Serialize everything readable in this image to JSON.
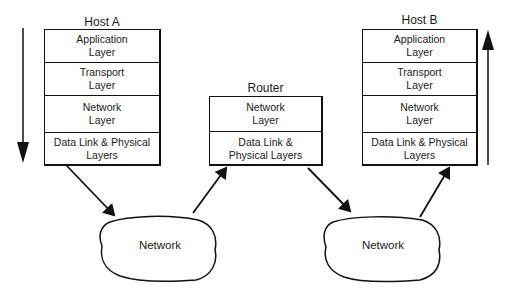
{
  "hostA": {
    "title": "Host A",
    "layers": [
      {
        "label": "Application\nLayer"
      },
      {
        "label": "Transport\nLayer"
      },
      {
        "label": "Network\nLayer"
      },
      {
        "label": "Data Link & Physical\nLayers"
      }
    ],
    "direction_arrow": "down"
  },
  "router": {
    "title": "Router",
    "layers": [
      {
        "label": "Network\nLayer"
      },
      {
        "label": "Data Link &\nPhysical Layers"
      }
    ]
  },
  "hostB": {
    "title": "Host B",
    "layers": [
      {
        "label": "Application\nLayer"
      },
      {
        "label": "Transport\nLayer"
      },
      {
        "label": "Network\nLayer"
      },
      {
        "label": "Data Link & Physical\nLayers"
      }
    ],
    "direction_arrow": "up"
  },
  "networks": [
    {
      "label": "Network"
    },
    {
      "label": "Network"
    }
  ]
}
